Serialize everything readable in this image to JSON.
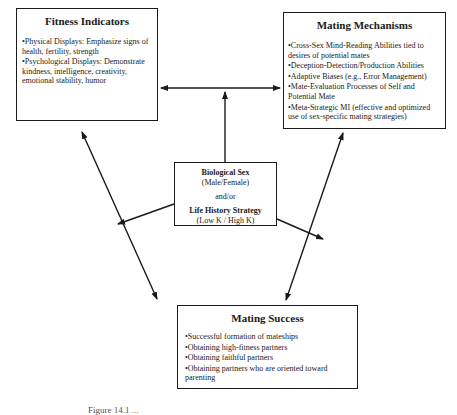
{
  "fitness_indicators": {
    "title": "Fitness Indicators",
    "items": [
      "Physical Displays: Emphasize signs of health, fertility, strength",
      "Psychological Displays: Demonstrate kindness, intelligence, creativity, emotional stability, humor"
    ]
  },
  "mating_mechanisms": {
    "title": "Mating Mechanisms",
    "items": [
      "Cross-Sex Mind-Reading Abilities tied to desires of potential mates",
      "Deception-Detection/Production Abilities",
      "Adaptive Biases (e.g., Error Management)",
      "Mate-Evaluation Processes of Self and Potential Mate",
      "Meta-Strategic MI (effective and optimized use of sex-specific mating strategies)"
    ]
  },
  "center": {
    "title1": "Biological Sex",
    "sub1": "(Male/Female)",
    "connector": "and/or",
    "title2": "Life History Strategy",
    "sub2": "(Low K / High K)"
  },
  "mating_success": {
    "title": "Mating Success",
    "items": [
      "Successful formation of mateships",
      "Obtaining high-fitness partners",
      "Obtaining faithful partners",
      "Obtaining partners who are oriented toward parenting"
    ]
  },
  "caption": "Figure 14.1 ..."
}
